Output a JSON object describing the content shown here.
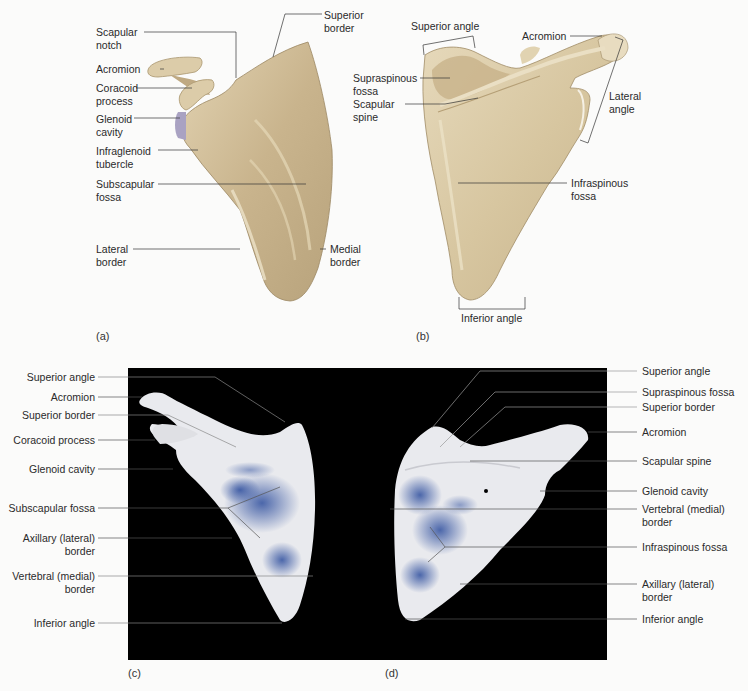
{
  "figure": {
    "panels": [
      {
        "id": "a",
        "tag": "(a)",
        "view": "anterior illustration",
        "labels": [
          {
            "text": "Scapular\nnotch"
          },
          {
            "text": "Acromion"
          },
          {
            "text": "Coracoid\nprocess"
          },
          {
            "text": "Glenoid\ncavity"
          },
          {
            "text": "Infraglenoid\ntubercle"
          },
          {
            "text": "Subscapular\nfossa"
          },
          {
            "text": "Lateral\nborder"
          },
          {
            "text": "Superior\nborder"
          },
          {
            "text": "Medial\nborder"
          }
        ]
      },
      {
        "id": "b",
        "tag": "(b)",
        "view": "posterior illustration",
        "labels": [
          {
            "text": "Superior angle"
          },
          {
            "text": "Acromion"
          },
          {
            "text": "Supraspinous\nfossa"
          },
          {
            "text": "Scapular\nspine"
          },
          {
            "text": "Lateral\nangle"
          },
          {
            "text": "Infraspinous\nfossa"
          },
          {
            "text": "Inferior angle"
          }
        ]
      },
      {
        "id": "c",
        "tag": "(c)",
        "view": "anterior photograph",
        "labels": [
          {
            "text": "Superior angle"
          },
          {
            "text": "Acromion"
          },
          {
            "text": "Superior border"
          },
          {
            "text": "Coracoid process"
          },
          {
            "text": "Glenoid cavity"
          },
          {
            "text": "Subscapular fossa"
          },
          {
            "text": "Axillary (lateral)\nborder"
          },
          {
            "text": "Vertebral (medial)\nborder"
          },
          {
            "text": "Inferior angle"
          }
        ]
      },
      {
        "id": "d",
        "tag": "(d)",
        "view": "posterior photograph",
        "labels": [
          {
            "text": "Superior angle"
          },
          {
            "text": "Supraspinous fossa"
          },
          {
            "text": "Superior border"
          },
          {
            "text": "Acromion"
          },
          {
            "text": "Scapular spine"
          },
          {
            "text": "Glenoid cavity"
          },
          {
            "text": "Vertebral (medial)\nborder"
          },
          {
            "text": "Infraspinous fossa"
          },
          {
            "text": "Axillary (lateral)\nborder"
          },
          {
            "text": "Inferior angle"
          }
        ]
      }
    ]
  },
  "colors": {
    "bone": "#d8c6a2",
    "bone_shadow": "#b49f78",
    "bone_highlight": "#ece2c8",
    "glenoid": "#a9a2c2",
    "photo_bg": "#000000",
    "photo_bone": "#e9eaee",
    "stain_blue": "#2f4f9e",
    "leader_line": "#333333"
  }
}
